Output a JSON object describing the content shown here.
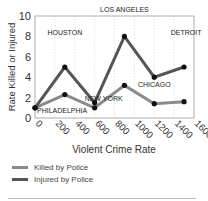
{
  "chart_data": {
    "type": "line",
    "title": "",
    "xlabel": "Violent Crime Rate",
    "ylabel": "Rate Killed or Injured",
    "xlim": [
      0,
      1600
    ],
    "ylim": [
      0,
      10
    ],
    "xticks": [
      0,
      200,
      400,
      600,
      800,
      1000,
      1200,
      1400,
      1600
    ],
    "yticks": [
      0,
      2,
      4,
      6,
      8,
      10
    ],
    "grid": "vertical dashed",
    "legend_position": "bottom",
    "x": [
      0,
      300,
      600,
      900,
      1200,
      1500
    ],
    "point_labels": [
      "PHILADELPHIA",
      "HOUSTON",
      "NEW YORK",
      "LOS ANGELES",
      "CHICAGO",
      "DETROIT"
    ],
    "series": [
      {
        "name": "Killed by Police",
        "color": "#8a8a8a",
        "values": [
          1.0,
          2.3,
          1.0,
          3.2,
          1.4,
          1.6
        ]
      },
      {
        "name": "Injured by Police",
        "color": "#555555",
        "values": [
          1.0,
          5.0,
          1.5,
          8.0,
          4.0,
          5.0
        ]
      }
    ]
  },
  "legend": {
    "killed_label": "Killed by Police",
    "injured_label": "Injured by Police"
  }
}
